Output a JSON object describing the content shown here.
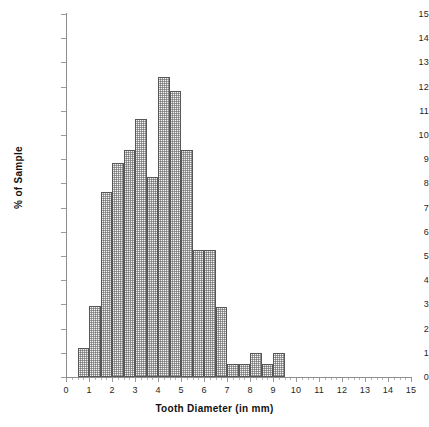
{
  "chart_data": {
    "type": "bar",
    "title": "",
    "subtitle": "",
    "xlabel": "Tooth Diameter (in mm)",
    "ylabel": "% of Sample",
    "xlim": [
      0,
      15
    ],
    "ylim": [
      0,
      15
    ],
    "x_tick_labels": [
      "0",
      "1",
      "2",
      "3",
      "4",
      "5",
      "6",
      "7",
      "8",
      "9",
      "10",
      "11",
      "12",
      "13",
      "14",
      "15"
    ],
    "y_tick_labels": [
      "0",
      "1",
      "2",
      "3",
      "4",
      "5",
      "6",
      "7",
      "8",
      "9",
      "10",
      "11",
      "12",
      "13",
      "14",
      "15"
    ],
    "grid": false,
    "legend": null,
    "bin_width": 0.5,
    "bin_edges": [
      0.5,
      1.0,
      1.5,
      2.0,
      2.5,
      3.0,
      3.5,
      4.0,
      4.5,
      5.0,
      5.5,
      6.0,
      6.5,
      7.0,
      7.5,
      8.0,
      8.5,
      9.0,
      9.5
    ],
    "categories": [
      "0.5-1.0",
      "1.0-1.5",
      "1.5-2.0",
      "2.0-2.5",
      "2.5-3.0",
      "3.0-3.5",
      "3.5-4.0",
      "4.0-4.5",
      "4.5-5.0",
      "5.0-5.5",
      "5.5-6.0",
      "6.0-6.5",
      "6.5-7.0",
      "7.0-7.5",
      "7.5-8.0",
      "8.0-8.5",
      "8.5-9.0",
      "9.0-9.5"
    ],
    "values": [
      1.2,
      2.95,
      7.65,
      8.85,
      9.4,
      10.65,
      8.25,
      12.4,
      11.8,
      9.4,
      5.25,
      5.25,
      2.9,
      0.55,
      0.55,
      1.0,
      0.55,
      1.0
    ],
    "bar_fill": "#f3f3f3",
    "bar_pattern": "cross-hatch-dither",
    "bar_border_color": "#575757",
    "axis_color": "#8d8d8d"
  }
}
